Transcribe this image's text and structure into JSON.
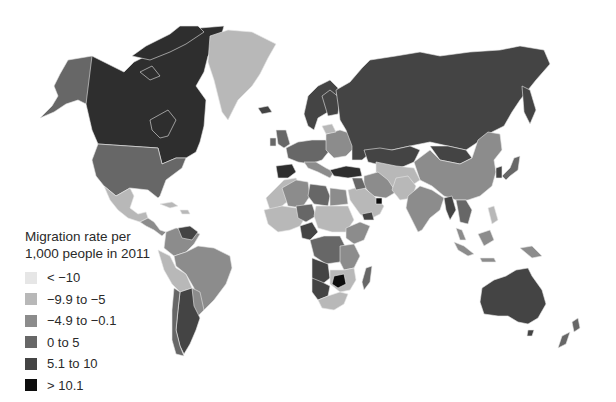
{
  "map": {
    "type": "choropleth",
    "projection": "world",
    "legend": {
      "title_line1": "Migration rate per",
      "title_line2": "1,000 people in 2011",
      "items": [
        {
          "label": "< −10",
          "color": "#e6e6e6"
        },
        {
          "label": "−9.9 to −5",
          "color": "#b8b8b8"
        },
        {
          "label": "−4.9 to −0.1",
          "color": "#8c8c8c"
        },
        {
          "label": "0 to 5",
          "color": "#676767"
        },
        {
          "label": "5.1 to 10",
          "color": "#444444"
        },
        {
          "label": "> 10.1",
          "color": "#0d0d0d"
        }
      ]
    },
    "colors": {
      "lt_neg10": "#e6e6e6",
      "neg9_9_to_neg5": "#b8b8b8",
      "neg4_9_to_neg0_1": "#8c8c8c",
      "zero_to_5": "#676767",
      "five_to_10": "#444444",
      "gt_10": "#0d0d0d",
      "background": "#ffffff"
    }
  }
}
